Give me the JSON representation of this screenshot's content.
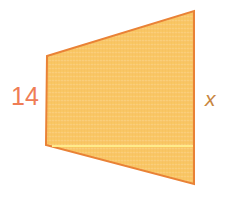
{
  "figure": {
    "type": "trapezoid-diagram",
    "canvas": {
      "width": 228,
      "height": 197,
      "background": "#ffffff"
    },
    "shape": {
      "name": "trapezoid",
      "fill_color": "#f8c463",
      "fill_color_light": "#fbd184",
      "stroke_color": "#e98236",
      "stroke_width": 2,
      "points": "47,56 194,11 194,184 46,145",
      "vertices": [
        {
          "name": "top-left",
          "x": 47,
          "y": 56
        },
        {
          "name": "top-right",
          "x": 194,
          "y": 11
        },
        {
          "name": "bottom-right",
          "x": 194,
          "y": 184
        },
        {
          "name": "bottom-left",
          "x": 46,
          "y": 145
        }
      ]
    },
    "interior_line": {
      "name": "horizontal-guide-line",
      "color": "#ffeb8a",
      "stroke_width": 2,
      "x1": 52,
      "y1": 146,
      "x2": 193,
      "y2": 146
    },
    "labels": {
      "left": {
        "text": "14",
        "color": "#ef7d55",
        "style": "normal"
      },
      "right": {
        "text": "x",
        "color": "#c8863f",
        "style": "italic"
      }
    }
  }
}
